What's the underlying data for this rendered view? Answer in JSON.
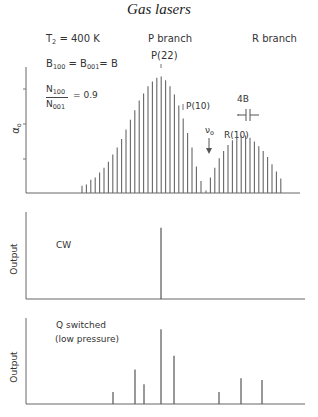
{
  "header": {
    "title": "Gas lasers"
  },
  "panels": {
    "top": {
      "ylabel": "α",
      "ylabel_sub": "o",
      "params": {
        "temp_prefix": "T",
        "temp_sub": "2",
        "temp_value": " = 400 K",
        "b_prefix": "B",
        "b_sub1": "100",
        "b_mid": " = B",
        "b_sub2": "001",
        "b_suffix": "= B",
        "ratio_num": "N",
        "ratio_num_sub": "100",
        "ratio_den": "N",
        "ratio_den_sub": "001",
        "ratio_value": "= 0.9"
      },
      "labels": {
        "p_branch": "P branch",
        "r_branch": "R branch",
        "p22": "P(22)",
        "p10": "P(10)",
        "r10": "R(10)",
        "spacing": "4B",
        "nu0": "ν",
        "nu0_sub": "o"
      }
    },
    "middle": {
      "ylabel": "Output",
      "annotation": "CW"
    },
    "bottom": {
      "ylabel": "Output",
      "annotation_line1": "Q switched",
      "annotation_line2": "(low pressure)"
    }
  },
  "chart_data": [
    {
      "type": "bar",
      "title": "Gain coefficient α0 vs frequency (CO2 P and R branch rotational lines)",
      "xlabel": "frequency",
      "ylabel": "α0",
      "annotations": [
        "T2 = 400 K",
        "B100 = B001 = B",
        "N100/N001 = 0.9",
        "P branch",
        "R branch",
        "P(22)",
        "P(10)",
        "R(10)",
        "4B",
        "ν0"
      ],
      "series": [
        {
          "name": "P branch",
          "x": [
            82,
            86.4,
            90.8,
            95.2,
            99.6,
            104,
            108.4,
            112.8,
            117.2,
            121.6,
            126,
            130.4,
            134.8,
            139.2,
            143.6,
            148,
            152.4,
            156.8,
            161.2,
            165.6,
            170,
            174.4,
            178.8,
            183.2,
            187.6,
            192
          ],
          "values": [
            0.06,
            0.07,
            0.11,
            0.13,
            0.17,
            0.21,
            0.26,
            0.32,
            0.38,
            0.45,
            0.53,
            0.61,
            0.69,
            0.77,
            0.83,
            0.89,
            0.93,
            0.96,
            0.97,
            0.94,
            0.89,
            0.82,
            0.73,
            0.62,
            0.5,
            0.38
          ]
        },
        {
          "name": "P branch tail",
          "x": [
            196.4,
            201
          ],
          "values": [
            0.22,
            0.1
          ]
        },
        {
          "name": "R branch",
          "x": [
            206,
            210.4,
            214.8,
            219.2,
            223.6,
            228,
            232.4,
            236.8,
            241.2,
            245.6,
            250,
            254.4,
            258.8,
            263.2,
            267.6,
            272,
            276.4,
            280.8
          ],
          "values": [
            0.02,
            0.13,
            0.21,
            0.29,
            0.35,
            0.4,
            0.44,
            0.47,
            0.48,
            0.48,
            0.46,
            0.43,
            0.39,
            0.35,
            0.3,
            0.24,
            0.18,
            0.12
          ]
        }
      ],
      "ylim": [
        0,
        1
      ],
      "grid": false
    },
    {
      "type": "bar",
      "title": "CW output",
      "ylabel": "Output",
      "x": [
        161
      ],
      "values": [
        0.82
      ],
      "ylim": [
        0,
        1
      ]
    },
    {
      "type": "bar",
      "title": "Q switched (low pressure) output",
      "ylabel": "Output",
      "x": [
        113,
        135,
        144,
        161,
        174,
        219,
        241,
        262
      ],
      "values": [
        0.14,
        0.4,
        0.23,
        0.87,
        0.56,
        0.14,
        0.3,
        0.28
      ],
      "ylim": [
        0,
        1
      ]
    }
  ]
}
